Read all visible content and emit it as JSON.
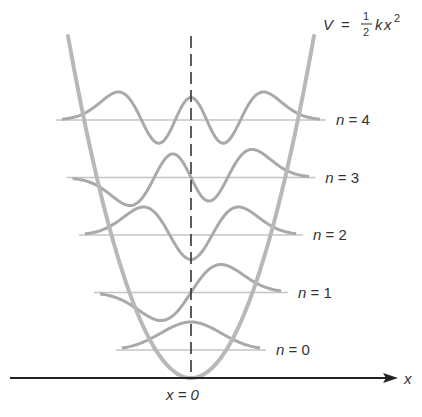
{
  "diagram": {
    "potential_label": {
      "V": "V",
      "eq": "=",
      "num": "1",
      "den": "2",
      "k": "k",
      "x": "x",
      "exp": "2"
    },
    "axis_label": "x",
    "origin_label": "x = 0",
    "levels": [
      {
        "n": 0,
        "label": "n = 0"
      },
      {
        "n": 1,
        "label": "n = 1"
      },
      {
        "n": 2,
        "label": "n = 2"
      },
      {
        "n": 3,
        "label": "n = 3"
      },
      {
        "n": 4,
        "label": "n = 4"
      }
    ],
    "colors": {
      "axis": "#222222",
      "potential": "#b8b8b8",
      "wavefunction": "#a9a9a9",
      "energy_level": "#c4c4c4",
      "dashed": "#333333",
      "text": "#333333"
    }
  }
}
